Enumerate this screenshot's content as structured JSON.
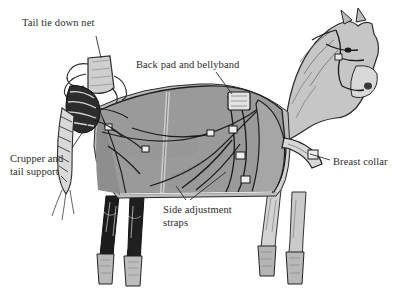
{
  "figure": {
    "background_color": "#ffffff",
    "text_color": "#2b2b2b",
    "blanket_color": "#9a9a9a",
    "blanket_shadow_color": "#7f7f7f",
    "body_color": "#c9c9c9",
    "dark_leg_color": "#1e1e1e",
    "line_color": "#1a1a1a"
  },
  "labels": {
    "tail_tie_down_net": "Tail tie down net",
    "back_pad_and_bellyband": "Back pad and bellyband",
    "crupper_and_tail_support": "Crupper and\ntail support",
    "breast_collar": "Breast collar",
    "side_adjustment_straps": "Side adjustment\nstraps"
  }
}
